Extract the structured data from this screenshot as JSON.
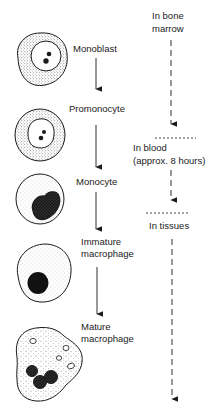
{
  "diagram": {
    "title": "",
    "stages": [
      {
        "id": "monoblast",
        "label": "Monoblast"
      },
      {
        "id": "promonocyte",
        "label": "Promonocyte"
      },
      {
        "id": "monocyte",
        "label": "Monocyte"
      },
      {
        "id": "immature-macrophage",
        "label_line1": "Immature",
        "label_line2": "macrophage"
      },
      {
        "id": "mature-macrophage",
        "label_line1": "Mature",
        "label_line2": "macrophage"
      }
    ],
    "locations": [
      {
        "id": "bone-marrow",
        "label_line1": "In bone",
        "label_line2": "marrow"
      },
      {
        "id": "blood",
        "label_line1": "In blood",
        "label_line2": "(approx. 8 hours)"
      },
      {
        "id": "tissues",
        "label_line1": "In tissues"
      }
    ],
    "colors": {
      "ink": "#1a1a1a",
      "background": "#ffffff"
    }
  }
}
